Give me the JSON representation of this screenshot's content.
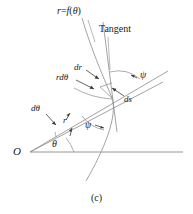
{
  "figure": {
    "caption": "(c)",
    "background_color": "#ffffff",
    "stroke_color": "#7a7a7a",
    "text_color": "#1a1a1a",
    "width": 193,
    "height": 214
  },
  "labels": {
    "curve_equation": "r = f(θ)",
    "curve_equation_lhs": "r",
    "curve_equation_eq": "=",
    "curve_equation_fn": "f",
    "curve_equation_open": "(",
    "curve_equation_arg": "θ",
    "curve_equation_close": ")",
    "tangent": "Tangent",
    "dr": "dr",
    "r_dtheta": "rdθ",
    "d_theta": "dθ",
    "ds": "ds",
    "r": "r",
    "theta": "θ",
    "psi_upper": "ψ",
    "psi_lower": "ψ",
    "origin": "O"
  },
  "geometry": {
    "origin_point": [
      30,
      152
    ],
    "curve_point": [
      111,
      96
    ],
    "polar_axis_end": [
      183,
      152
    ],
    "radial_ray_end": [
      168,
      72
    ],
    "radial_ray_secondary_end": [
      168,
      79
    ],
    "tangent_top": [
      104,
      22
    ],
    "tangent_bottom": [
      116,
      130
    ],
    "curve_top": [
      82,
      18
    ],
    "curve_bottom": [
      86,
      181
    ],
    "theta_angle_deg": 35,
    "psi_angle_deg": 118
  }
}
